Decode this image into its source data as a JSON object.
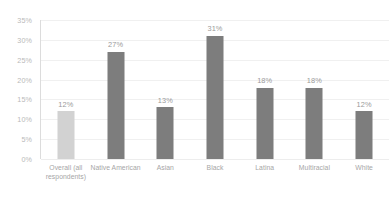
{
  "chart_data": {
    "type": "bar",
    "title": "",
    "subtitle": "",
    "xlabel": "",
    "ylabel": "",
    "ylim": [
      0,
      35
    ],
    "grid": true,
    "legend": "none",
    "y_ticks": [
      "0%",
      "5%",
      "10%",
      "15%",
      "20%",
      "25%",
      "30%",
      "35%"
    ],
    "y_tick_values": [
      0,
      5,
      10,
      15,
      20,
      25,
      30,
      35
    ],
    "categories": [
      "Overall (all respondents)",
      "Native American",
      "Asian",
      "Black",
      "Latina",
      "Multiracial",
      "White"
    ],
    "values": [
      12,
      27,
      13,
      31,
      18,
      18,
      12
    ],
    "value_labels": [
      "12%",
      "27%",
      "13%",
      "31%",
      "18%",
      "18%",
      "12%"
    ],
    "bar_colors": [
      "#d2d2d2",
      "#7d7d7d",
      "#7d7d7d",
      "#7d7d7d",
      "#7d7d7d",
      "#7d7d7d",
      "#7d7d7d"
    ],
    "colors": {
      "highlight_bar": "#d2d2d2",
      "default_bar": "#7d7d7d",
      "gridline": "#f0f0f0",
      "axis_line": "#dcdcdc",
      "tick_text": "#b9b9b9",
      "value_text": "#9a9a9a",
      "category_text": "#a6a6a6",
      "background": "#ffffff"
    }
  }
}
